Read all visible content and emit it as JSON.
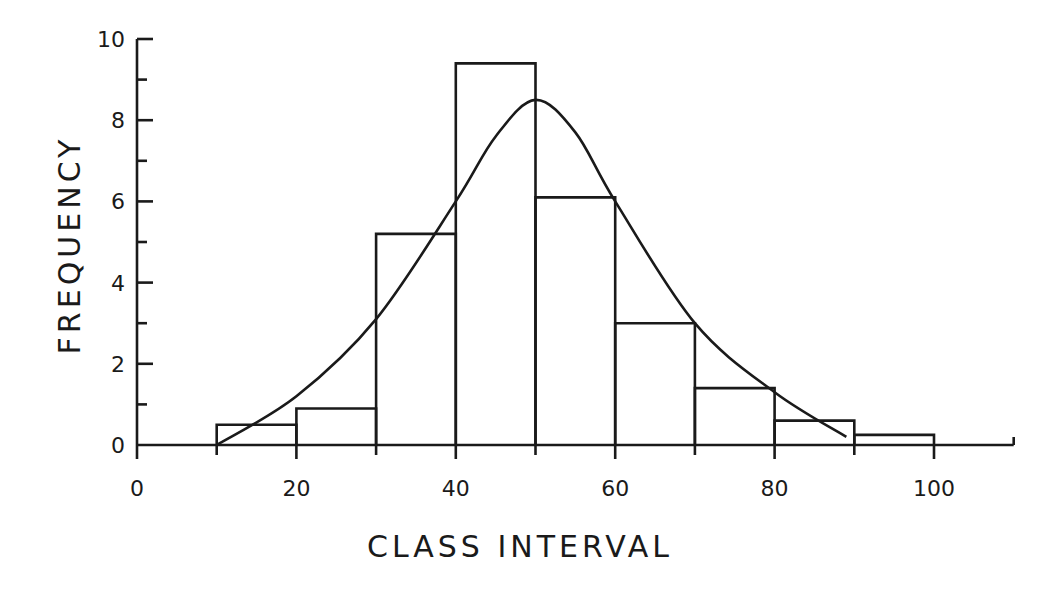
{
  "chart_data": {
    "type": "bar",
    "subtype": "histogram-with-normal-curve",
    "title": "",
    "xlabel": "CLASS INTERVAL",
    "ylabel": "FREQUENCY",
    "xlim": [
      0,
      110
    ],
    "ylim": [
      0,
      10
    ],
    "x_tick_labels": [
      "0",
      "20",
      "40",
      "60",
      "80",
      "100"
    ],
    "x_major_ticks": [
      0,
      20,
      40,
      60,
      80,
      100
    ],
    "x_minor_ticks": [
      10,
      30,
      50,
      70,
      90
    ],
    "y_tick_labels": [
      "0",
      "2",
      "4",
      "6",
      "8",
      "10"
    ],
    "y_major_ticks": [
      0,
      2,
      4,
      6,
      8,
      10
    ],
    "y_minor_ticks": [
      1,
      3,
      5,
      7,
      9
    ],
    "grid": false,
    "legend": null,
    "categories": [
      "10-20",
      "20-30",
      "30-40",
      "40-50",
      "50-60",
      "60-70",
      "70-80",
      "80-90",
      "90-100"
    ],
    "bins": [
      {
        "from": 10,
        "to": 20,
        "value": 0.5
      },
      {
        "from": 20,
        "to": 30,
        "value": 0.9
      },
      {
        "from": 30,
        "to": 40,
        "value": 5.2
      },
      {
        "from": 40,
        "to": 50,
        "value": 9.4
      },
      {
        "from": 50,
        "to": 60,
        "value": 6.1
      },
      {
        "from": 60,
        "to": 70,
        "value": 3.0
      },
      {
        "from": 70,
        "to": 80,
        "value": 1.4
      },
      {
        "from": 80,
        "to": 90,
        "value": 0.6
      },
      {
        "from": 90,
        "to": 100,
        "value": 0.25
      }
    ],
    "values": [
      0.5,
      0.9,
      5.2,
      9.4,
      6.1,
      3.0,
      1.4,
      0.6,
      0.25
    ],
    "series": [
      {
        "name": "fitted curve",
        "type": "line",
        "x": [
          10,
          20,
          30,
          40,
          45,
          50,
          55,
          60,
          70,
          80,
          89
        ],
        "y": [
          0.0,
          1.2,
          3.1,
          6.0,
          7.6,
          8.5,
          7.7,
          6.0,
          3.0,
          1.3,
          0.2
        ]
      }
    ]
  }
}
